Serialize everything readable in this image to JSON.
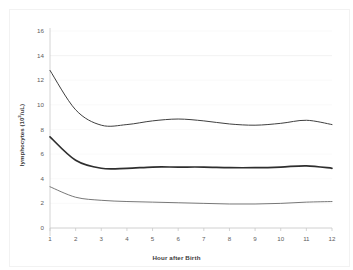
{
  "figure": {
    "clipped_caption": "",
    "background_color": "#ffffff",
    "line_color": "#3f3f3f",
    "border_color": "#f2f2f2",
    "gridline_color": "#f0f0f0"
  },
  "chart_data": {
    "type": "line",
    "title": "",
    "xlabel": "Hour after Birth",
    "ylabel": "lymphocytes (10³/uL)",
    "ylabel_base": "lymphocytes (10",
    "ylabel_exponent": "3",
    "ylabel_tail": "/uL)",
    "x": [
      1,
      2,
      3,
      4,
      5,
      6,
      7,
      8,
      9,
      10,
      11,
      12
    ],
    "xtick_labels": [
      "1",
      "2",
      "3",
      "4",
      "5",
      "6",
      "7",
      "8",
      "9",
      "10",
      "11",
      "12"
    ],
    "ytick_labels": [
      "0",
      "2",
      "4",
      "6",
      "8",
      "10",
      "12",
      "14",
      "16"
    ],
    "yticks": [
      0,
      2,
      4,
      6,
      8,
      10,
      12,
      14,
      16
    ],
    "xlim": [
      1,
      12
    ],
    "ylim": [
      0,
      16
    ],
    "grid": "horizontal-faint",
    "legend": "none",
    "series": [
      {
        "name": "upper reference curve",
        "line_width": 1.0,
        "color": "#3f3f3f",
        "values": [
          12.8,
          9.6,
          8.35,
          8.4,
          8.7,
          8.85,
          8.7,
          8.45,
          8.35,
          8.5,
          8.75,
          8.4
        ]
      },
      {
        "name": "middle reference curve",
        "line_width": 1.7,
        "color": "#2e2e2e",
        "values": [
          7.4,
          5.5,
          4.85,
          4.85,
          4.95,
          4.95,
          4.95,
          4.9,
          4.9,
          4.95,
          5.05,
          4.85
        ]
      },
      {
        "name": "lower reference curve",
        "line_width": 0.8,
        "color": "#555555",
        "values": [
          3.35,
          2.5,
          2.25,
          2.15,
          2.1,
          2.05,
          2.0,
          1.95,
          1.95,
          2.0,
          2.1,
          2.15
        ]
      }
    ]
  }
}
